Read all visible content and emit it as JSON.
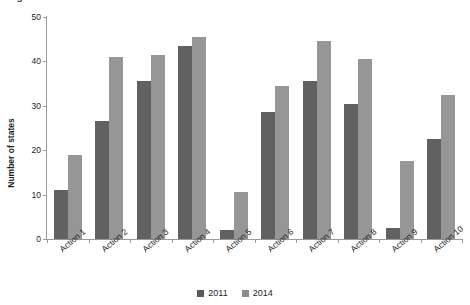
{
  "figure": {
    "title": "Figure 3. Number of states with each action"
  },
  "legend": {
    "position": "bottom-center",
    "items": [
      {
        "label": "2011",
        "color": "#595959"
      },
      {
        "label": "2014",
        "color": "#8c8c8c"
      }
    ]
  },
  "axes": {
    "ylabel": "Number of states",
    "xlabel": "",
    "yticks": [
      "0",
      "10",
      "20",
      "30",
      "40",
      "50"
    ],
    "ymin": 0,
    "ymax": 50
  },
  "chart_data": {
    "type": "bar",
    "title": "Figure 3. Number of states with each action",
    "xlabel": "",
    "ylabel": "Number of states",
    "ylim": [
      0,
      50
    ],
    "ytick_values": [
      0,
      10,
      20,
      30,
      40,
      50
    ],
    "grid": false,
    "legend_position": "bottom-center",
    "categories": [
      "Action 1",
      "Action 2",
      "Action 3",
      "Action 4",
      "Action 5",
      "Action 6",
      "Action 7",
      "Action 8",
      "Action 9",
      "Action 10"
    ],
    "series": [
      {
        "name": "2011",
        "color": "#616161",
        "values": [
          11,
          26.5,
          35.5,
          43.5,
          2,
          28.5,
          35.5,
          30.5,
          2.5,
          22.5
        ]
      },
      {
        "name": "2014",
        "color": "#969696",
        "values": [
          19,
          41,
          41.5,
          45.5,
          10.5,
          34.5,
          44.5,
          40.5,
          17.5,
          32.5
        ]
      }
    ]
  }
}
